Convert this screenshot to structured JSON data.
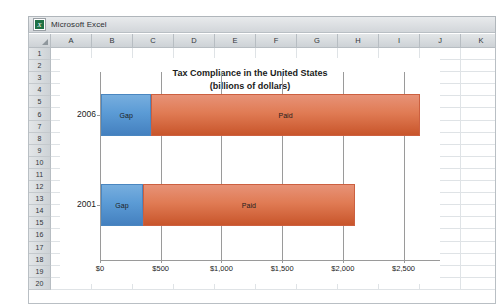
{
  "window": {
    "title": "Microsoft Excel",
    "icon": "excel-icon"
  },
  "spreadsheet": {
    "columns": [
      "A",
      "B",
      "C",
      "D",
      "E",
      "F",
      "G",
      "H",
      "I",
      "J",
      "K"
    ],
    "rows": [
      "1",
      "2",
      "3",
      "4",
      "5",
      "6",
      "7",
      "8",
      "9",
      "10",
      "11",
      "12",
      "13",
      "14",
      "15",
      "16",
      "17",
      "18",
      "19",
      "20"
    ]
  },
  "chart_data": {
    "type": "bar",
    "orientation": "horizontal",
    "stacked": true,
    "title": "Tax Compliance in the United States",
    "subtitle": "(billions of dollars)",
    "xlabel": "",
    "ylabel": "",
    "categories": [
      "2006",
      "2001"
    ],
    "series": [
      {
        "name": "Gap",
        "values": [
          415,
          345
        ],
        "color": "#5b9bd5"
      },
      {
        "name": "Paid",
        "values": [
          2210,
          1745
        ],
        "color": "#e07b54"
      }
    ],
    "totals": [
      2625,
      2090
    ],
    "xlim": [
      0,
      2800
    ],
    "ticks": [
      0,
      500,
      1000,
      1500,
      2000,
      2500
    ],
    "tick_labels": [
      "$0",
      "$500",
      "$1,000",
      "$1,500",
      "$2,000",
      "$2,500"
    ],
    "grid": true,
    "legend": "none",
    "data_labels": [
      "Gap",
      "Paid"
    ]
  }
}
